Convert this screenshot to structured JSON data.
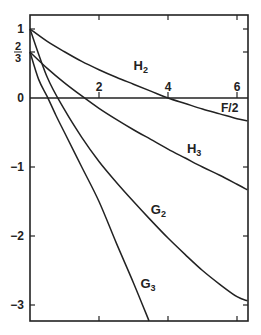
{
  "chart_data": {
    "type": "line",
    "title": "",
    "xlabel": "F/2",
    "ylabel": "",
    "xlim": [
      0,
      6.3
    ],
    "ylim": [
      -3.25,
      1.2
    ],
    "grid": false,
    "legend": "inline labels",
    "x_ticks": [
      {
        "value": 2,
        "label": "2"
      },
      {
        "value": 4,
        "label": "4"
      },
      {
        "value": 6,
        "label": "6"
      }
    ],
    "y_ticks": [
      {
        "value": 1,
        "label": "1"
      },
      {
        "value": 0.6667,
        "label": "2/3"
      },
      {
        "value": 0,
        "label": "0"
      },
      {
        "value": -1,
        "label": "-1"
      },
      {
        "value": -2,
        "label": "-2"
      },
      {
        "value": -3,
        "label": "-3"
      }
    ],
    "series": [
      {
        "name": "H2",
        "label_main": "H",
        "label_sub": "2",
        "label_pos": [
          3.0,
          0.4
        ],
        "x": [
          0,
          0.5,
          1,
          1.5,
          2,
          2.5,
          3,
          3.5,
          4,
          4.5,
          5,
          5.5,
          6,
          6.3
        ],
        "y": [
          1.0,
          0.82,
          0.67,
          0.53,
          0.41,
          0.3,
          0.2,
          0.1,
          0.0,
          -0.08,
          -0.16,
          -0.23,
          -0.3,
          -0.33
        ]
      },
      {
        "name": "H3",
        "label_main": "H",
        "label_sub": "3",
        "label_pos": [
          4.55,
          -0.8
        ],
        "x": [
          0,
          0.5,
          1,
          1.5,
          2,
          2.5,
          3,
          3.5,
          4,
          4.5,
          5,
          5.5,
          6,
          6.3
        ],
        "y": [
          0.6667,
          0.43,
          0.22,
          0.03,
          -0.15,
          -0.31,
          -0.46,
          -0.6,
          -0.74,
          -0.87,
          -1.0,
          -1.12,
          -1.25,
          -1.33
        ]
      },
      {
        "name": "G2",
        "label_main": "G",
        "label_sub": "2",
        "label_pos": [
          3.5,
          -1.68
        ],
        "x": [
          0,
          0.5,
          1,
          1.5,
          2,
          2.5,
          3,
          3.5,
          4,
          4.5,
          5,
          5.5,
          6,
          6.3
        ],
        "y": [
          1.0,
          0.3,
          -0.17,
          -0.57,
          -0.92,
          -1.22,
          -1.5,
          -1.77,
          -2.03,
          -2.27,
          -2.5,
          -2.7,
          -2.88,
          -2.94
        ]
      },
      {
        "name": "G3",
        "label_main": "G",
        "label_sub": "3",
        "label_pos": [
          3.2,
          -2.75
        ],
        "x": [
          0,
          0.25,
          0.5,
          0.75,
          1,
          1.5,
          2,
          2.5,
          3,
          3.45
        ],
        "y": [
          0.6667,
          0.27,
          0.02,
          -0.25,
          -0.5,
          -1.0,
          -1.5,
          -2.1,
          -2.68,
          -3.23
        ]
      }
    ]
  }
}
